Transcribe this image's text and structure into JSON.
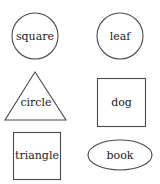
{
  "items": [
    {
      "label": "square",
      "shape": "circle"
    },
    {
      "label": "leaf",
      "shape": "circle"
    },
    {
      "label": "circle",
      "shape": "triangle"
    },
    {
      "label": "dog",
      "shape": "square"
    },
    {
      "label": "triangle",
      "shape": "square"
    },
    {
      "label": "book",
      "shape": "ellipse"
    }
  ],
  "colors": {
    "stroke": "#4a4a4a",
    "text": "#222222",
    "background": "#ffffff"
  }
}
